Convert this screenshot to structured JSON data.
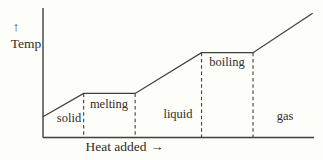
{
  "colors": {
    "background": "#fdfdfa",
    "ink": "#413f38",
    "text": "#2f2d29"
  },
  "icons": {
    "up_arrow": "↑",
    "right_arrow": "→"
  },
  "axis": {
    "y_label": "Temp",
    "x_label": "Heat added"
  },
  "chart_data": {
    "type": "line",
    "title": "",
    "xlabel": "Heat added",
    "ylabel": "Temp",
    "xlim": [
      0,
      100
    ],
    "ylim": [
      0,
      100
    ],
    "grid": false,
    "legend": "none",
    "x": [
      0,
      15,
      34,
      58.5,
      77.5,
      99.5
    ],
    "series": [
      {
        "name": "temperature",
        "values": [
          16,
          34,
          34,
          65.5,
          65.5,
          96
        ]
      }
    ],
    "guide_indices": [
      1,
      2,
      3,
      4
    ],
    "phases": [
      {
        "label": "solid"
      },
      {
        "label": "melting"
      },
      {
        "label": "liquid"
      },
      {
        "label": "boiling"
      },
      {
        "label": "gas"
      }
    ]
  }
}
